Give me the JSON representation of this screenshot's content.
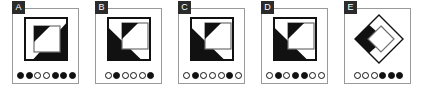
{
  "strip": {
    "name": "multiple-choice-figure-options",
    "background_color": "#ffffff",
    "panel_border_color": "#9a9a9a",
    "badge_background_color": "#2b2b2b",
    "badge_text_color": "#ffffff",
    "ink_color": "#111111"
  },
  "panels": [
    {
      "letter": "A",
      "figure": {
        "name": "square-with-corner-triangles",
        "type": "nested-squares",
        "outer_square": {
          "x": 6,
          "y": 5,
          "size": 42
        },
        "inner_square": {
          "x": 15,
          "y": 13,
          "size": 26
        },
        "black_regions": [
          "top-left-inner-triangle",
          "bottom-right-outer-triangle"
        ]
      },
      "dots": [
        "filled",
        "filled",
        "open",
        "open",
        "filled",
        "filled",
        "filled"
      ],
      "dot_count": 7,
      "filled_count": 5
    },
    {
      "letter": "B",
      "figure": {
        "name": "square-with-corner-triangles",
        "type": "nested-squares",
        "outer_square": {
          "x": 6,
          "y": 5,
          "size": 42
        },
        "inner_square": {
          "x": 20,
          "y": 10,
          "size": 26
        },
        "black_regions": [
          "top-left-inner-triangle",
          "bottom-left-outer-triangle"
        ]
      },
      "dots": [
        "open",
        "filled",
        "open",
        "open",
        "open",
        "filled"
      ],
      "dot_count": 6,
      "filled_count": 2
    },
    {
      "letter": "C",
      "figure": {
        "name": "square-with-corner-triangles",
        "type": "nested-squares",
        "outer_square": {
          "x": 6,
          "y": 5,
          "size": 42
        },
        "inner_square": {
          "x": 20,
          "y": 10,
          "size": 26
        },
        "black_regions": [
          "top-left-inner-triangle",
          "bottom-left-outer-triangle"
        ]
      },
      "dots": [
        "open",
        "filled",
        "open",
        "open",
        "open",
        "filled",
        "open"
      ],
      "dot_count": 7,
      "filled_count": 2
    },
    {
      "letter": "D",
      "figure": {
        "name": "square-with-corner-triangles",
        "type": "nested-squares",
        "outer_square": {
          "x": 6,
          "y": 5,
          "size": 42
        },
        "inner_square": {
          "x": 20,
          "y": 10,
          "size": 26
        },
        "black_regions": [
          "top-left-inner-triangle",
          "bottom-left-outer-triangle"
        ]
      },
      "dots": [
        "open",
        "filled",
        "open",
        "filled",
        "filled",
        "open",
        "open"
      ],
      "dot_count": 7,
      "filled_count": 3
    },
    {
      "letter": "E",
      "figure": {
        "name": "nested-diamonds-with-left-black-wedge",
        "type": "nested-diamonds",
        "outer_diamond": {
          "cx": 31,
          "cy": 26,
          "rx": 24,
          "ry": 24
        },
        "inner_diamond": {
          "cx": 33,
          "cy": 26,
          "rx": 13,
          "ry": 13
        },
        "black_regions": [
          "left-wedge"
        ]
      },
      "dots": [
        "open",
        "open",
        "open",
        "filled",
        "filled",
        "filled"
      ],
      "dot_count": 6,
      "filled_count": 3
    }
  ]
}
